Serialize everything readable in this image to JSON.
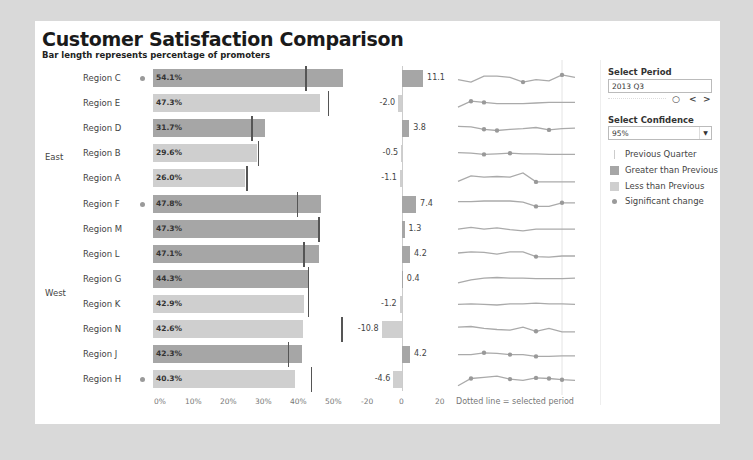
{
  "header": {
    "title": "Customer Satisfaction Comparison",
    "subtitle": "Bar length represents percentage of promoters"
  },
  "colors": {
    "greater": "#a6a6a6",
    "less": "#cfcfcf",
    "prev_marker": "#555555",
    "sig_dot": "#9a9a9a",
    "spark_line": "#aaaaaa"
  },
  "groups": [
    {
      "label": "East",
      "row_start": 0,
      "row_end": 4
    },
    {
      "label": "West",
      "row_start": 5,
      "row_end": 12
    }
  ],
  "chart_data": [
    {
      "type": "bar",
      "title": "Percentage of promoters",
      "categories": [
        "Region C",
        "Region E",
        "Region D",
        "Region B",
        "Region A",
        "Region F",
        "Region M",
        "Region L",
        "Region G",
        "Region K",
        "Region N",
        "Region J",
        "Region H"
      ],
      "series": [
        {
          "name": "Current",
          "values": [
            54.1,
            47.3,
            31.7,
            29.6,
            26.0,
            47.8,
            47.3,
            47.1,
            44.3,
            42.9,
            42.6,
            42.3,
            40.3
          ]
        },
        {
          "name": "Previous Quarter",
          "values": [
            43.3,
            49.6,
            27.9,
            29.8,
            26.5,
            40.8,
            46.9,
            42.7,
            44.0,
            44.0,
            53.4,
            38.3,
            44.8
          ]
        }
      ],
      "labels": [
        "54.1%",
        "47.3%",
        "31.7%",
        "29.6%",
        "26.0%",
        "47.8%",
        "47.3%",
        "47.1%",
        "44.3%",
        "42.9%",
        "42.6%",
        "42.3%",
        "40.3%"
      ],
      "xticks": [
        "0%",
        "10%",
        "20%",
        "30%",
        "40%",
        "50%"
      ],
      "xlim": [
        0,
        55
      ]
    },
    {
      "type": "bar",
      "title": "Change vs previous quarter",
      "categories": [
        "Region C",
        "Region E",
        "Region D",
        "Region B",
        "Region A",
        "Region F",
        "Region M",
        "Region L",
        "Region G",
        "Region K",
        "Region N",
        "Region J",
        "Region H"
      ],
      "values": [
        11.1,
        -2.0,
        3.8,
        -0.5,
        -1.1,
        7.4,
        1.3,
        4.2,
        0.4,
        -1.2,
        -10.8,
        4.2,
        -4.6
      ],
      "xticks": [
        "-20",
        "0",
        "20"
      ],
      "xlim": [
        -20,
        20
      ]
    },
    {
      "type": "line",
      "title": "Trend sparklines",
      "note": "Dotted line = selected period"
    }
  ],
  "rows": [
    {
      "region": "Region C",
      "value": 54.1,
      "label": "54.1%",
      "prev": 43.3,
      "change": 11.1,
      "change_label": "11.1",
      "sig": true,
      "spark": [
        0.4,
        0.2,
        0.7,
        0.7,
        0.6,
        0.2,
        0.4,
        0.3,
        0.8,
        0.6
      ],
      "dots": [
        5,
        8
      ]
    },
    {
      "region": "Region E",
      "value": 47.3,
      "label": "47.3%",
      "prev": 49.6,
      "change": -2.0,
      "change_label": "-2.0",
      "sig": false,
      "spark": [
        0.2,
        0.7,
        0.6,
        0.5,
        0.5,
        0.5,
        0.55,
        0.6,
        0.6,
        0.6
      ],
      "dots": [
        1,
        2
      ]
    },
    {
      "region": "Region D",
      "value": 31.7,
      "label": "31.7%",
      "prev": 27.9,
      "change": 3.8,
      "change_label": "3.8",
      "sig": false,
      "spark": [
        0.7,
        0.65,
        0.45,
        0.35,
        0.45,
        0.5,
        0.6,
        0.4,
        0.5,
        0.55
      ],
      "dots": [
        2,
        3,
        7
      ]
    },
    {
      "region": "Region B",
      "value": 29.6,
      "label": "29.6%",
      "prev": 29.8,
      "change": -0.5,
      "change_label": "-0.5",
      "sig": false,
      "spark": [
        0.6,
        0.55,
        0.45,
        0.5,
        0.55,
        0.5,
        0.5,
        0.45,
        0.45,
        0.45
      ],
      "dots": [
        2,
        4
      ]
    },
    {
      "region": "Region A",
      "value": 26.0,
      "label": "26.0%",
      "prev": 26.5,
      "change": -1.1,
      "change_label": "-1.1",
      "sig": false,
      "spark": [
        0.3,
        0.75,
        0.65,
        0.7,
        0.65,
        1.0,
        0.25,
        0.25,
        0.25,
        0.25
      ],
      "dots": [
        6
      ]
    },
    {
      "region": "Region F",
      "value": 47.8,
      "label": "47.8%",
      "prev": 40.8,
      "change": 7.4,
      "change_label": "7.4",
      "sig": true,
      "spark": [
        0.7,
        0.7,
        0.75,
        0.75,
        0.75,
        0.65,
        0.3,
        0.3,
        0.6,
        0.6
      ],
      "dots": [
        6,
        8
      ]
    },
    {
      "region": "Region M",
      "value": 47.3,
      "label": "47.3%",
      "prev": 46.9,
      "change": 1.3,
      "change_label": "1.3",
      "sig": false,
      "spark": [
        0.5,
        0.65,
        0.5,
        0.6,
        0.45,
        0.35,
        0.5,
        0.5,
        0.5,
        0.5
      ],
      "dots": []
    },
    {
      "region": "Region L",
      "value": 47.1,
      "label": "47.1%",
      "prev": 42.7,
      "change": 4.2,
      "change_label": "4.2",
      "sig": false,
      "spark": [
        0.6,
        0.7,
        0.65,
        0.5,
        0.7,
        0.7,
        0.3,
        0.25,
        0.35,
        0.35
      ],
      "dots": [
        6
      ]
    },
    {
      "region": "Region G",
      "value": 44.3,
      "label": "44.3%",
      "prev": 44.0,
      "change": 0.4,
      "change_label": "0.4",
      "sig": false,
      "spark": [
        0.2,
        0.45,
        0.6,
        0.65,
        0.6,
        0.6,
        0.55,
        0.55,
        0.55,
        0.6
      ],
      "dots": []
    },
    {
      "region": "Region K",
      "value": 42.9,
      "label": "42.9%",
      "prev": 44.0,
      "change": -1.2,
      "change_label": "-1.2",
      "sig": false,
      "spark": [
        0.5,
        0.55,
        0.5,
        0.45,
        0.55,
        0.55,
        0.6,
        0.55,
        0.55,
        0.5
      ],
      "dots": []
    },
    {
      "region": "Region N",
      "value": 42.6,
      "label": "42.6%",
      "prev": 53.4,
      "change": -10.8,
      "change_label": "-10.8",
      "sig": false,
      "spark": [
        0.7,
        0.75,
        0.6,
        0.5,
        0.45,
        0.7,
        0.35,
        0.6,
        0.3,
        0.3
      ],
      "dots": [
        6
      ]
    },
    {
      "region": "Region J",
      "value": 42.3,
      "label": "42.3%",
      "prev": 38.3,
      "change": 4.2,
      "change_label": "4.2",
      "sig": false,
      "spark": [
        0.5,
        0.5,
        0.65,
        0.6,
        0.5,
        0.5,
        0.35,
        0.35,
        0.4,
        0.4
      ],
      "dots": [
        2,
        4,
        6
      ]
    },
    {
      "region": "Region H",
      "value": 40.3,
      "label": "40.3%",
      "prev": 44.8,
      "change": -4.6,
      "change_label": "-4.6",
      "sig": true,
      "spark": [
        0.0,
        0.6,
        0.7,
        0.8,
        0.55,
        0.45,
        0.65,
        0.6,
        0.5,
        0.45
      ],
      "dots": [
        1,
        4,
        6,
        7,
        8
      ]
    }
  ],
  "axes": {
    "pct_ticks": [
      "0%",
      "10%",
      "20%",
      "30%",
      "40%",
      "50%"
    ],
    "change_ticks": [
      "-20",
      "0",
      "20"
    ],
    "spark_note": "Dotted line = selected period"
  },
  "controls": {
    "period_label": "Select Period",
    "period_value": "2013 Q3",
    "play_icon": "○",
    "prev_icon": "<",
    "next_icon": ">",
    "confidence_label": "Select Confidence",
    "confidence_value": "95%",
    "dropdown_icon": "▼"
  },
  "legend": [
    {
      "label": "Previous Quarter",
      "type": "line"
    },
    {
      "label": "Greater than Previous",
      "type": "greater"
    },
    {
      "label": "Less than Previous",
      "type": "less"
    },
    {
      "label": "Significant change",
      "type": "dot"
    }
  ]
}
